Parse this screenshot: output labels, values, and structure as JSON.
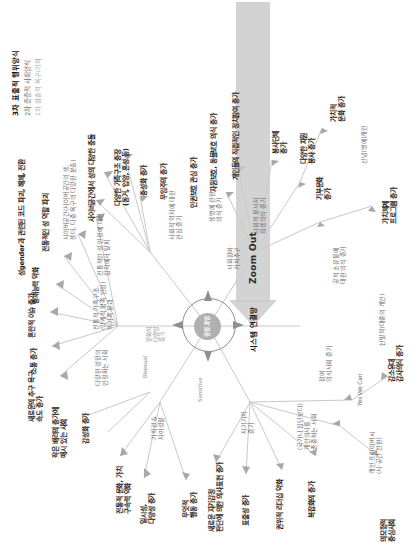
{
  "meta": {
    "orientation": "rotated-90-ccw",
    "colors": {
      "level1": "#8e8e8e",
      "level2": "#6b6b6b",
      "level3": "#1b1b1b",
      "center_core": "#b0b0b0",
      "zoom_arrow": "#c9c9c9",
      "link": "#c4c4c4"
    }
  },
  "legend": {
    "items": [
      {
        "rank": "3차",
        "label": "3차 표출적 행위양식",
        "level": "l3"
      },
      {
        "rank": "2차",
        "label": "2차 층층적 사회양식",
        "level": "l2"
      },
      {
        "rank": "1차",
        "label": "1차 심층적 욕구/가치",
        "level": "l1"
      }
    ]
  },
  "center": {
    "core_label": "감정\n과잉",
    "ring_label": "시스템 연결망",
    "sensitive_label": "Sensitive"
  },
  "zoom_control": {
    "label": "Zoom Out",
    "direction": "right"
  },
  "nodes": {
    "top_branch": [
      {
        "id": "n01",
        "label": "새로운의 추구 욕구\n속도 증가",
        "level": "l3"
      },
      {
        "id": "n02",
        "label": "소통 증가",
        "level": "l3"
      },
      {
        "id": "n03",
        "label": "혼란적 이슈 증가",
        "level": "l3"
      },
      {
        "id": "n04",
        "label": "중재능력 약화",
        "level": "l3"
      },
      {
        "id": "n05",
        "label": "성gender과 관련된 코드 파괴, 해체, 전환",
        "level": "l3"
      },
      {
        "id": "n06",
        "label": "전통적인 성 역할 파괴",
        "level": "l3"
      },
      {
        "id": "n07",
        "label": "사이버공간(사이버공간의 생,\n젠더, 다중 욕구의 다양한 분출)",
        "level": "l2"
      },
      {
        "id": "n08",
        "label": "사이버공간에서 성의 다양한 충돌",
        "level": "l3"
      },
      {
        "id": "n09",
        "label": "다양한 가족구조 증장\n(동거, 입양, 혼성 등)",
        "level": "l3"
      },
      {
        "id": "n10",
        "label": "중성화 증가",
        "level": "l3"
      },
      {
        "id": "n11",
        "label": "무임주의 증가",
        "level": "l3"
      }
    ],
    "upper_mid_branch": [
      {
        "id": "n12",
        "label": "작은 배려의 증가에\n매시 있는 사회",
        "level": "l3"
      },
      {
        "id": "n13",
        "label": "감성화 증가",
        "level": "l3"
      },
      {
        "id": "n14",
        "label": "다양한 성향의\n인정화는 사회",
        "level": "l2"
      },
      {
        "id": "n15",
        "label": "전통적 가족구조,\n(양계적 혈족 인정)\n핵가족 붕괴",
        "level": "l2"
      },
      {
        "id": "n16",
        "label": "전통적인 성 인정에 대한\n집착에서 탈피",
        "level": "l2"
      },
      {
        "id": "n17",
        "label": "Bisexual",
        "level": "l1"
      },
      {
        "id": "n18",
        "label": "문화적\n다양성\n증가",
        "level": "l1"
      }
    ],
    "left_branch": [
      {
        "id": "n19",
        "label": "전통적 문화, 가치\n구속력 약화",
        "level": "l3"
      },
      {
        "id": "n20",
        "label": "일시성,\n다양성 증가",
        "level": "l3"
      },
      {
        "id": "n21",
        "label": "무엇적\n행동 증가",
        "level": "l3"
      },
      {
        "id": "n22",
        "label": "가치관 &\n자아성찰",
        "level": "l2"
      },
      {
        "id": "n23",
        "label": "자기가치\n증가",
        "level": "l2"
      },
      {
        "id": "n24",
        "label": "새로운 자기감정\n판단에 의한 의사표현 증가",
        "level": "l3"
      },
      {
        "id": "n25",
        "label": "표출성 증가",
        "level": "l3"
      },
      {
        "id": "n26",
        "label": "권위적 리더십 약화",
        "level": "l3"
      },
      {
        "id": "n27",
        "label": "복잡화의 증가",
        "level": "l3"
      },
      {
        "id": "n28",
        "label": "(국가나 집단보다)\n개인의사를\n존중하는 사회",
        "level": "l2"
      },
      {
        "id": "n29",
        "label": "개인 프라이버시\n(사·공간 전환)",
        "level": "l2"
      },
      {
        "id": "n30",
        "label": "Yes We Can",
        "level": "l2"
      },
      {
        "id": "n31",
        "label": "감소유대\n감사의식 증가",
        "level": "l3"
      },
      {
        "id": "n32",
        "label": "산발적(대중의 개인)",
        "level": "l2"
      },
      {
        "id": "n33",
        "label": "의모형적\n중심사회",
        "level": "l3"
      },
      {
        "id": "n34",
        "label": "참여\n의식사회 증가",
        "level": "l2"
      }
    ],
    "right_branch": [
      {
        "id": "n35",
        "label": "인권보호 관심 증가",
        "level": "l3"
      },
      {
        "id": "n36",
        "label": "자원보호, 동물보호 의식 증가",
        "level": "l3"
      },
      {
        "id": "n37",
        "label": "개인들의 직접적인 정치참여 증가",
        "level": "l3"
      },
      {
        "id": "n38",
        "label": "사회적 약자에 대한\n관심 증가",
        "level": "l2"
      },
      {
        "id": "n39",
        "label": "생명에 관한\n의식 증가",
        "level": "l2"
      },
      {
        "id": "n40",
        "label": "사회참여·\n가치추구",
        "level": "l2"
      },
      {
        "id": "n41",
        "label": "사회적 봉사자\n희생의식 증가",
        "level": "l2"
      },
      {
        "id": "n42",
        "label": "봉사단체\n증가",
        "level": "l3"
      },
      {
        "id": "n43",
        "label": "다양한 차원\n봉사 증가",
        "level": "l3"
      },
      {
        "id": "n44",
        "label": "기부문화\n증가",
        "level": "l3"
      },
      {
        "id": "n45",
        "label": "가치적\n문화 증가",
        "level": "l3"
      },
      {
        "id": "n46",
        "label": "가치체계\n프로그램 증가",
        "level": "l3"
      },
      {
        "id": "n47",
        "label": "공적 소유물에\n대한 의식 증가",
        "level": "l2"
      },
      {
        "id": "n48",
        "label": "신념(명예)개인",
        "level": "l2"
      }
    ]
  }
}
